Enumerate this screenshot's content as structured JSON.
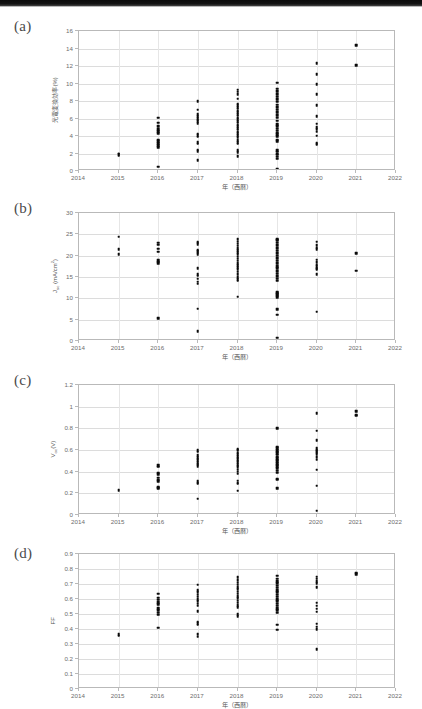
{
  "figure": {
    "xlabel": "年（西暦）",
    "xticks": [
      "2014",
      "2015",
      "2016",
      "2017",
      "2018",
      "2019",
      "2020",
      "2021",
      "2022"
    ],
    "xlim": [
      2014,
      2022
    ],
    "marker_color": "#0a0a0a",
    "grid": "horizontal"
  },
  "panels": [
    {
      "tag": "(a)",
      "key": "a"
    },
    {
      "tag": "(b)",
      "key": "b"
    },
    {
      "tag": "(c)",
      "key": "c"
    },
    {
      "tag": "(d)",
      "key": "d"
    }
  ],
  "chart_data": [
    {
      "type": "scatter",
      "panel": "(a)",
      "title": "",
      "xlabel": "年（西暦）",
      "ylabel": "光電変換効率(%)",
      "ylabel_plain": "Power conversion efficiency (%)",
      "xlim": [
        2014,
        2022
      ],
      "ylim": [
        0,
        16
      ],
      "yticks": [
        0,
        2,
        4,
        6,
        8,
        10,
        12,
        14,
        16
      ],
      "xticks": [
        2014,
        2015,
        2016,
        2017,
        2018,
        2019,
        2020,
        2021,
        2022
      ],
      "grid": "horizontal",
      "points": [
        {
          "x": 2015,
          "y": [
            1.75,
            1.9,
            2.0
          ]
        },
        {
          "x": 2016,
          "y": [
            0.5,
            2.7,
            2.95,
            3.2,
            3.4,
            3.6,
            4.3,
            4.55,
            4.8,
            5.15,
            5.5,
            6.1
          ]
        },
        {
          "x": 2017,
          "y": [
            1.25,
            2.25,
            2.45,
            3.1,
            3.3,
            3.9,
            4.1,
            4.25,
            5.45,
            5.7,
            5.85,
            6.05,
            6.25,
            6.5,
            7.0,
            8.0
          ]
        },
        {
          "x": 2018,
          "y": [
            1.7,
            2.15,
            2.35,
            3.1,
            3.3,
            3.5,
            3.85,
            4.1,
            4.3,
            4.5,
            4.7,
            4.9,
            5.1,
            5.3,
            5.5,
            5.7,
            5.9,
            6.1,
            6.3,
            6.5,
            6.7,
            6.9,
            7.1,
            7.3,
            7.5,
            7.7,
            8.25,
            8.8,
            9.05,
            9.3
          ]
        },
        {
          "x": 2019,
          "y": [
            0.2,
            1.4,
            1.65,
            1.85,
            2.0,
            2.2,
            2.4,
            3.4,
            3.6,
            4.0,
            4.2,
            4.4,
            4.6,
            4.85,
            5.1,
            5.35,
            5.75,
            6.1,
            6.4,
            6.7,
            7.0,
            7.3,
            7.6,
            7.9,
            8.2,
            8.5,
            8.8,
            9.1,
            9.4,
            10.1
          ]
        },
        {
          "x": 2020,
          "y": [
            0.0,
            3.0,
            3.1,
            3.25,
            4.05,
            4.5,
            4.75,
            5.0,
            5.4,
            6.25,
            7.55,
            8.75,
            9.95,
            11.05,
            12.3
          ]
        },
        {
          "x": 2021,
          "y": [
            12.1,
            14.4
          ]
        }
      ]
    },
    {
      "type": "scatter",
      "panel": "(b)",
      "title": "",
      "xlabel": "年（西暦）",
      "ylabel": "Jsc (mA/cm2)",
      "ylabel_plain": "Jsc (mA/cm^2)",
      "xlim": [
        2014,
        2022
      ],
      "ylim": [
        0,
        30
      ],
      "yticks": [
        0,
        5,
        10,
        15,
        20,
        25,
        30
      ],
      "xticks": [
        2014,
        2015,
        2016,
        2017,
        2018,
        2019,
        2020,
        2021,
        2022
      ],
      "grid": "horizontal",
      "points": [
        {
          "x": 2015,
          "y": [
            20.3,
            21.5,
            24.4
          ]
        },
        {
          "x": 2016,
          "y": [
            5.3,
            18.3,
            18.6,
            18.9,
            20.9,
            21.6,
            22.6,
            23.0
          ]
        },
        {
          "x": 2017,
          "y": [
            2.3,
            7.6,
            13.4,
            13.9,
            14.6,
            15.3,
            15.6,
            17.1,
            20.3,
            20.7,
            21.0,
            21.3,
            22.7,
            23.0,
            23.3
          ]
        },
        {
          "x": 2018,
          "y": [
            10.4,
            14.1,
            14.5,
            15.0,
            15.6,
            16.2,
            16.8,
            17.3,
            17.8,
            18.3,
            18.8,
            19.3,
            19.8,
            20.3,
            20.8,
            21.3,
            21.8,
            22.3,
            22.8,
            23.3,
            23.9
          ]
        },
        {
          "x": 2019,
          "y": [
            0.8,
            6.2,
            7.5,
            10.2,
            10.6,
            10.9,
            11.2,
            11.6,
            14.1,
            14.6,
            15.2,
            15.8,
            16.4,
            17.0,
            17.6,
            18.2,
            18.8,
            19.4,
            20.0,
            20.6,
            21.2,
            21.8,
            22.4,
            23.0,
            23.6,
            23.9
          ]
        },
        {
          "x": 2020,
          "y": [
            6.9,
            15.6,
            16.8,
            17.1,
            17.5,
            17.9,
            18.4,
            19.1,
            21.5,
            21.9,
            22.4,
            23.3
          ]
        },
        {
          "x": 2021,
          "y": [
            16.5,
            20.6
          ]
        }
      ]
    },
    {
      "type": "scatter",
      "panel": "(c)",
      "title": "",
      "xlabel": "年（西暦）",
      "ylabel": "Voc (V)",
      "ylabel_plain": "Voc (V)",
      "xlim": [
        2014,
        2022
      ],
      "ylim": [
        0,
        1.2
      ],
      "yticks": [
        0,
        0.2,
        0.4,
        0.6,
        0.8,
        1,
        1.2
      ],
      "xticks": [
        2014,
        2015,
        2016,
        2017,
        2018,
        2019,
        2020,
        2021,
        2022
      ],
      "grid": "horizontal",
      "points": [
        {
          "x": 2015,
          "y": [
            0.23
          ]
        },
        {
          "x": 2016,
          "y": [
            0.25,
            0.255,
            0.31,
            0.325,
            0.345,
            0.375,
            0.39,
            0.445,
            0.46
          ]
        },
        {
          "x": 2017,
          "y": [
            0.15,
            0.29,
            0.3,
            0.31,
            0.45,
            0.465,
            0.475,
            0.49,
            0.505,
            0.52,
            0.535,
            0.55,
            0.585,
            0.6
          ]
        },
        {
          "x": 2018,
          "y": [
            0.005,
            0.225,
            0.29,
            0.3,
            0.315,
            0.38,
            0.4,
            0.42,
            0.44,
            0.455,
            0.47,
            0.485,
            0.5,
            0.515,
            0.53,
            0.545,
            0.56,
            0.575,
            0.6,
            0.61
          ]
        },
        {
          "x": 2019,
          "y": [
            0.25,
            0.325,
            0.335,
            0.39,
            0.41,
            0.43,
            0.45,
            0.465,
            0.48,
            0.495,
            0.51,
            0.525,
            0.54,
            0.555,
            0.57,
            0.585,
            0.6,
            0.615,
            0.63,
            0.8
          ]
        },
        {
          "x": 2020,
          "y": [
            0.04,
            0.27,
            0.42,
            0.51,
            0.535,
            0.56,
            0.575,
            0.59,
            0.6,
            0.615,
            0.69,
            0.78,
            0.94
          ]
        },
        {
          "x": 2021,
          "y": [
            0.915,
            0.925,
            0.96
          ]
        }
      ]
    },
    {
      "type": "scatter",
      "panel": "(d)",
      "title": "",
      "xlabel": "年（西暦）",
      "ylabel": "FF",
      "ylabel_plain": "FF",
      "xlim": [
        2014,
        2022
      ],
      "ylim": [
        0,
        0.9
      ],
      "yticks": [
        0,
        0.1,
        0.2,
        0.3,
        0.4,
        0.5,
        0.6,
        0.7,
        0.8,
        0.9
      ],
      "xticks": [
        2014,
        2015,
        2016,
        2017,
        2018,
        2019,
        2020,
        2021,
        2022
      ],
      "grid": "horizontal",
      "points": [
        {
          "x": 2015,
          "y": [
            0.355,
            0.365
          ]
        },
        {
          "x": 2016,
          "y": [
            0.41,
            0.495,
            0.51,
            0.525,
            0.54,
            0.565,
            0.58,
            0.595,
            0.61,
            0.635
          ]
        },
        {
          "x": 2017,
          "y": [
            0.35,
            0.365,
            0.43,
            0.44,
            0.45,
            0.52,
            0.555,
            0.57,
            0.585,
            0.6,
            0.615,
            0.63,
            0.645,
            0.66,
            0.695
          ]
        },
        {
          "x": 2018,
          "y": [
            0.485,
            0.5,
            0.545,
            0.56,
            0.575,
            0.59,
            0.605,
            0.62,
            0.635,
            0.65,
            0.665,
            0.68,
            0.695,
            0.71,
            0.725,
            0.745
          ]
        },
        {
          "x": 2019,
          "y": [
            0.395,
            0.43,
            0.51,
            0.525,
            0.54,
            0.555,
            0.57,
            0.585,
            0.6,
            0.615,
            0.63,
            0.645,
            0.66,
            0.675,
            0.69,
            0.705,
            0.72,
            0.735,
            0.755
          ]
        },
        {
          "x": 2020,
          "y": [
            0.265,
            0.4,
            0.415,
            0.435,
            0.515,
            0.535,
            0.555,
            0.575,
            0.68,
            0.705,
            0.72,
            0.735,
            0.75
          ]
        },
        {
          "x": 2021,
          "y": [
            0.765,
            0.775
          ]
        }
      ]
    }
  ]
}
